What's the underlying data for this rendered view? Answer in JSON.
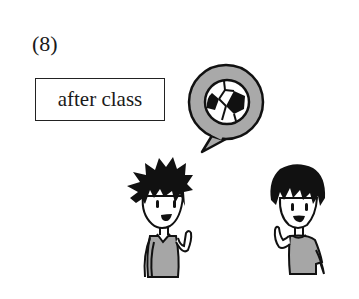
{
  "exercise": {
    "number_label": "(8)",
    "phrase": "after class"
  },
  "illustration": {
    "speech_bubble_icon": "soccer-ball-icon",
    "characters": [
      "boy-spiky-hair",
      "boy-short-hair"
    ],
    "colors": {
      "bubble_fill": "#a9a9a9",
      "shirt_fill": "#a6a6a6",
      "outline": "#111111"
    }
  }
}
